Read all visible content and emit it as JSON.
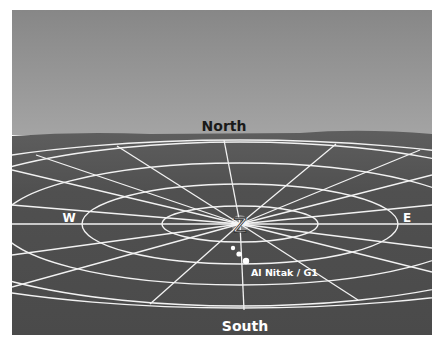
{
  "diagram": {
    "labels": {
      "north": "North",
      "south": "South",
      "west": "W",
      "east": "E",
      "zenith": "Z",
      "star": "Al Nitak / G1"
    },
    "colors": {
      "sky_top": "#8a8a8a",
      "sky_bottom": "#a2a2a2",
      "ground": "#4e4e4e",
      "grid": "#f2f2f2",
      "north_text": "#1a1a1a",
      "label_text": "#ffffff"
    },
    "points": [
      {
        "name": "dot-1",
        "x": 233,
        "y": 248,
        "r": 2.2
      },
      {
        "name": "dot-2",
        "x": 239,
        "y": 254,
        "r": 2.6
      },
      {
        "name": "dot-3",
        "x": 246,
        "y": 261,
        "r": 3.2
      }
    ]
  }
}
